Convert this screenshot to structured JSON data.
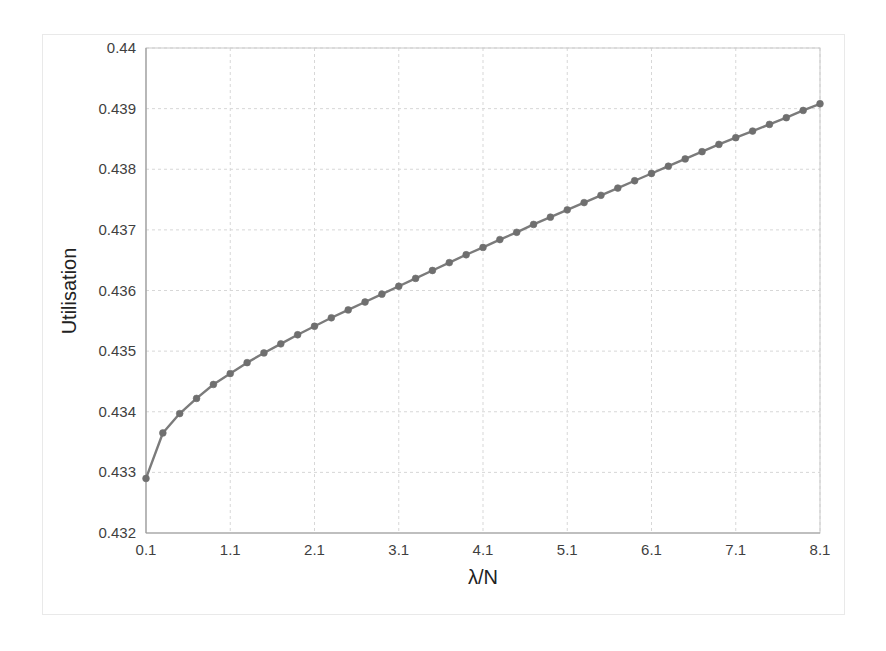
{
  "figure": {
    "background_color": "#ffffff",
    "border_color": "#e9e9e9"
  },
  "chart_data": {
    "type": "line",
    "title": "",
    "subtitle": "",
    "xlabel": "λ/N",
    "ylabel": "Utilisation",
    "xlim": [
      0.1,
      8.1
    ],
    "ylim": [
      0.432,
      0.44
    ],
    "xticks": [
      0.1,
      1.1,
      2.1,
      3.1,
      4.1,
      5.1,
      6.1,
      7.1,
      8.1
    ],
    "xtick_labels": [
      "0.1",
      "1.1",
      "2.1",
      "3.1",
      "4.1",
      "5.1",
      "6.1",
      "7.1",
      "8.1"
    ],
    "yticks": [
      0.432,
      0.433,
      0.434,
      0.435,
      0.436,
      0.437,
      0.438,
      0.439,
      0.44
    ],
    "ytick_labels": [
      "0.432",
      "0.433",
      "0.434",
      "0.435",
      "0.436",
      "0.437",
      "0.438",
      "0.439",
      "0.44"
    ],
    "grid": true,
    "grid_color": "#d7d7d7",
    "legend": false,
    "legend_position": "none",
    "marker": "circle",
    "line_color": "#7b7b7b",
    "marker_color": "#6f6f6f",
    "series": [
      {
        "name": "Utilisation",
        "x": [
          0.1,
          0.3,
          0.5,
          0.7,
          0.9,
          1.1,
          1.3,
          1.5,
          1.7,
          1.9,
          2.1,
          2.3,
          2.5,
          2.7,
          2.9,
          3.1,
          3.3,
          3.5,
          3.7,
          3.9,
          4.1,
          4.3,
          4.5,
          4.7,
          4.9,
          5.1,
          5.3,
          5.5,
          5.7,
          5.9,
          6.1,
          6.3,
          6.5,
          6.7,
          6.9,
          7.1,
          7.3,
          7.5,
          7.7,
          7.9,
          8.1
        ],
        "y": [
          0.4329,
          0.43365,
          0.43397,
          0.43422,
          0.43445,
          0.43463,
          0.43481,
          0.43497,
          0.43512,
          0.43527,
          0.43541,
          0.43555,
          0.43568,
          0.43581,
          0.43594,
          0.43607,
          0.4362,
          0.43633,
          0.43646,
          0.43659,
          0.43671,
          0.43684,
          0.43696,
          0.43709,
          0.43721,
          0.43733,
          0.43745,
          0.43757,
          0.43769,
          0.43781,
          0.43793,
          0.43805,
          0.43817,
          0.43829,
          0.43841,
          0.43852,
          0.43863,
          0.43874,
          0.43885,
          0.43897,
          0.43908
        ]
      }
    ]
  }
}
